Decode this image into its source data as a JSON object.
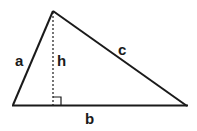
{
  "diagram": {
    "type": "triangle-with-altitude",
    "labels": {
      "side_left": "a",
      "side_right": "c",
      "base": "b",
      "height": "h"
    },
    "vertices": {
      "left": [
        13,
        105
      ],
      "apex": [
        53,
        11
      ],
      "right": [
        187,
        106
      ]
    },
    "stroke_color": "#1a1a1a",
    "right_angle_marker": true
  }
}
